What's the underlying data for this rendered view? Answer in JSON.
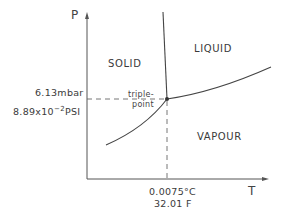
{
  "diagram": {
    "type": "phase-diagram",
    "axes": {
      "y_label": "P",
      "x_label": "T"
    },
    "regions": {
      "solid": "SOLID",
      "liquid": "LIQUID",
      "vapour": "VAPOUR"
    },
    "triple_point": {
      "label_line1": "triple-",
      "label_line2": "point",
      "pressure_mbar": "6.13mbar",
      "pressure_psi_base": "8.89x10",
      "pressure_psi_exp": "−2",
      "pressure_psi_unit": "PSI",
      "temperature_c": "0.0075°C",
      "temperature_f": "32.01 F"
    },
    "colors": {
      "line": "#444444",
      "dashed": "#555555",
      "text": "#3a3a3a"
    }
  }
}
